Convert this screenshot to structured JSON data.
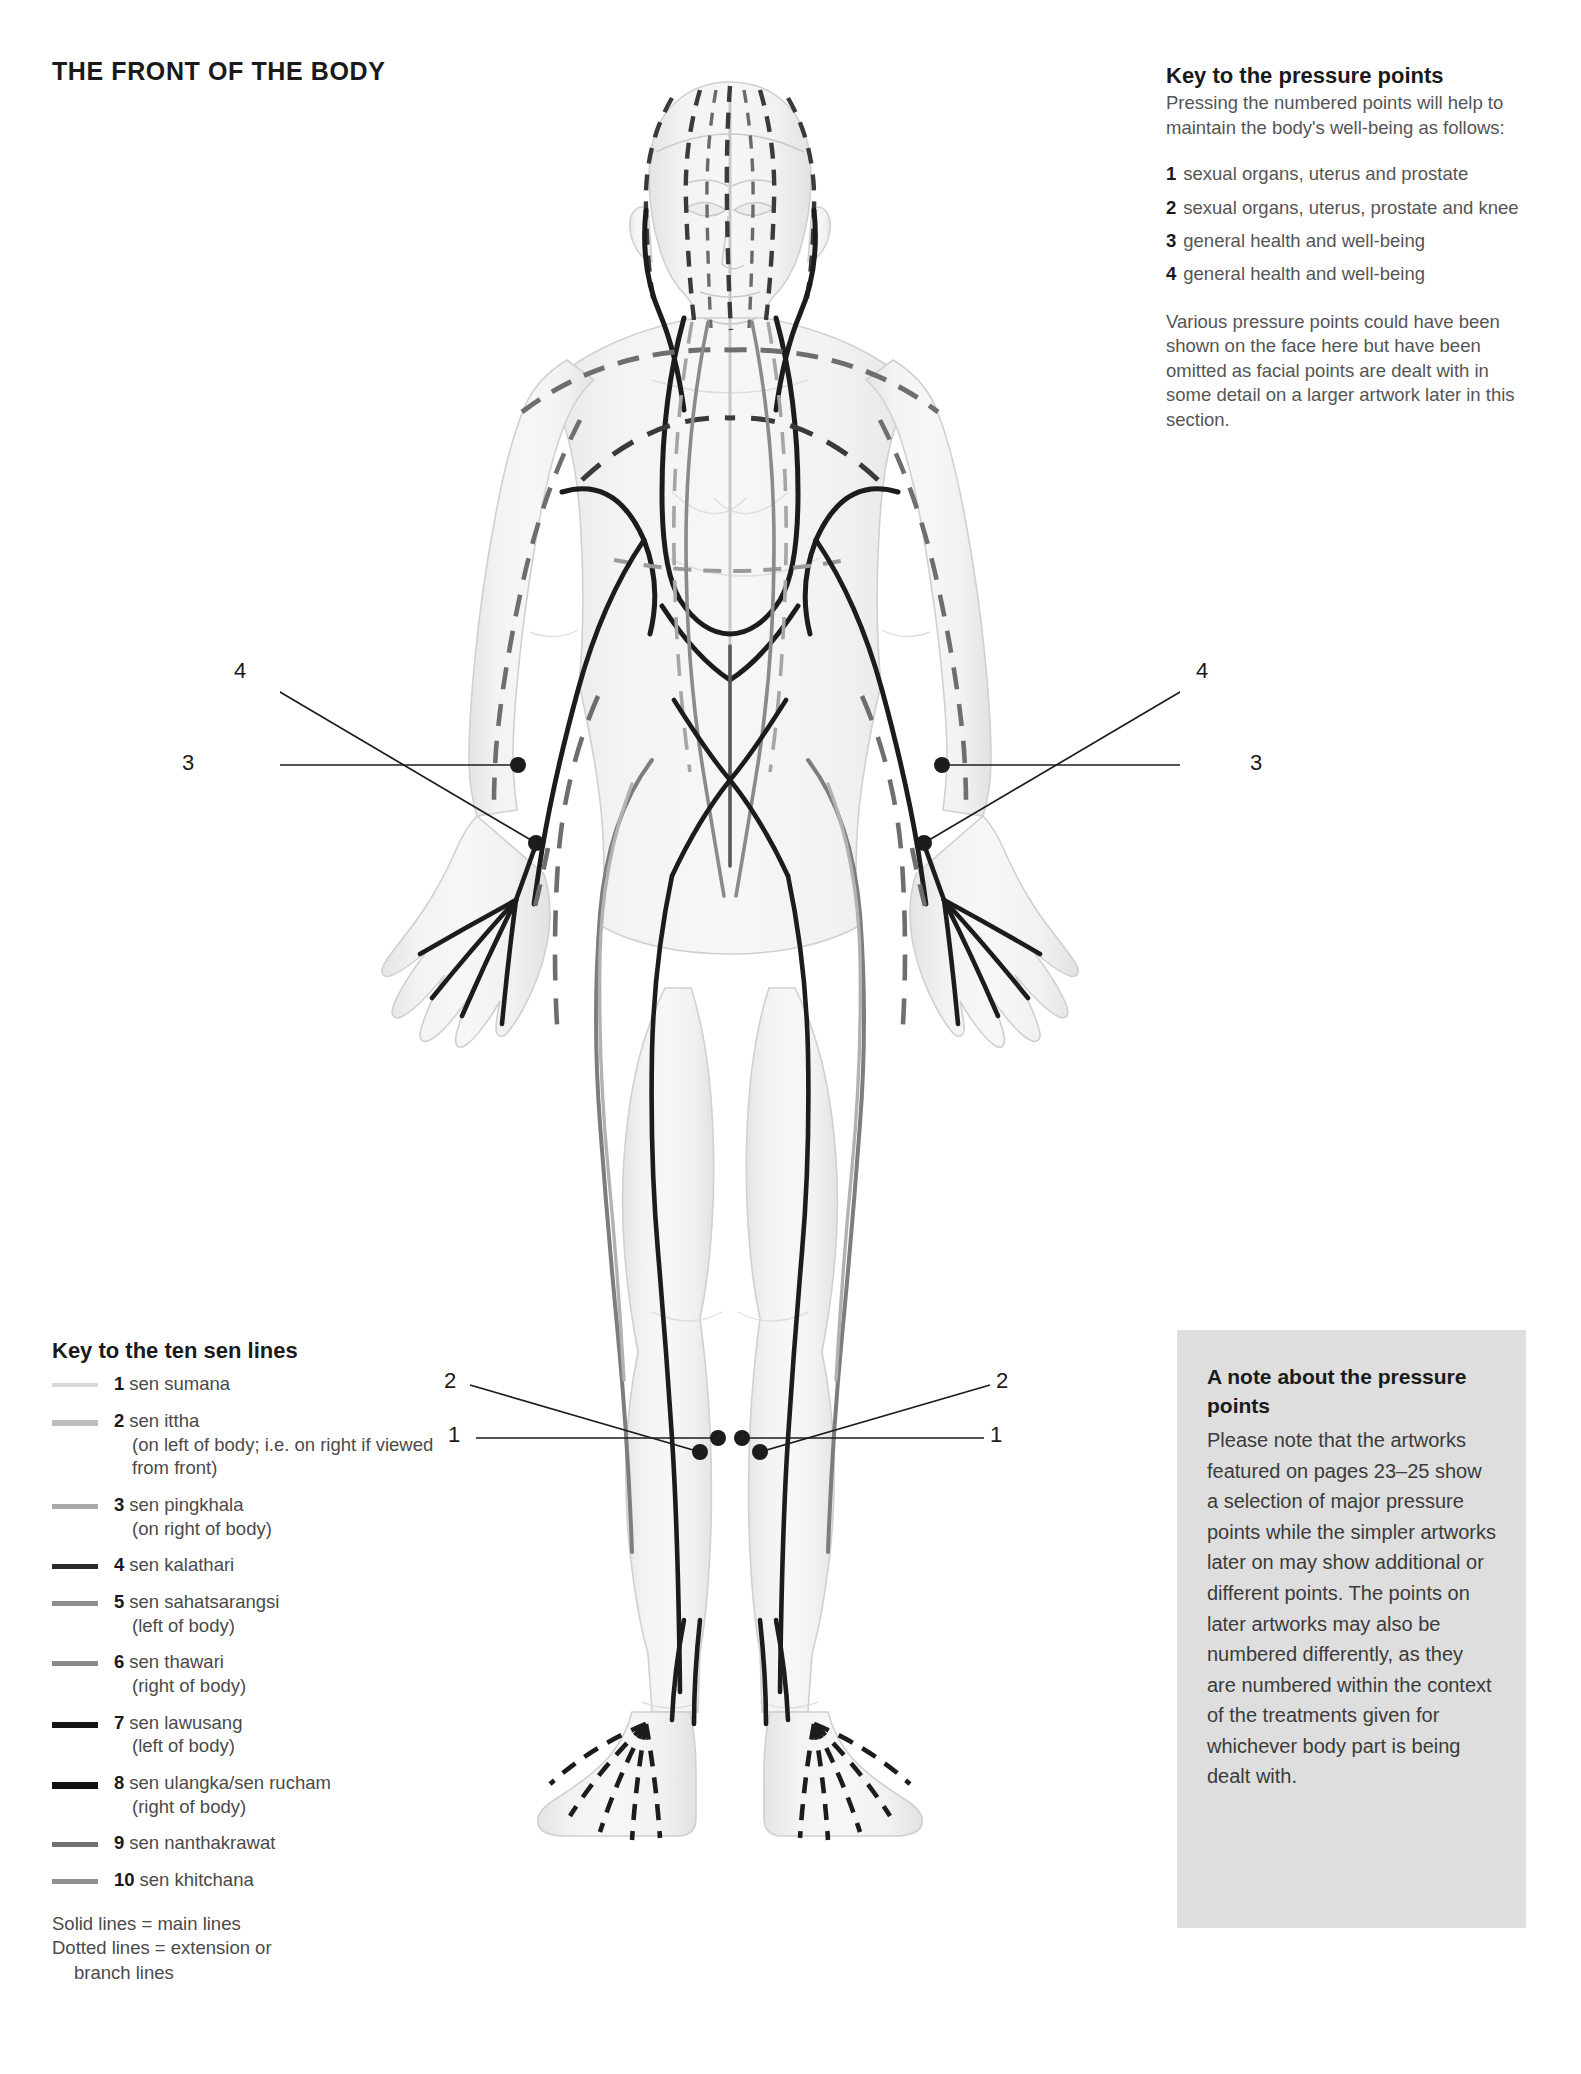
{
  "page": {
    "title": "THE FRONT OF THE BODY"
  },
  "pressure_key": {
    "heading": "Key to the pressure points",
    "intro": "Pressing the numbered points will help to maintain the body's well-being as follows:",
    "items": [
      {
        "num": "1",
        "text": "sexual organs, uterus and prostate"
      },
      {
        "num": "2",
        "text": "sexual organs, uterus, prostate and knee"
      },
      {
        "num": "3",
        "text": "general health and well-being"
      },
      {
        "num": "4",
        "text": "general health and well-being"
      }
    ],
    "footnote": "Various pressure points could have been shown on the face here but have been omitted as facial points are dealt with in some detail on a larger artwork later in this section."
  },
  "sen_key": {
    "heading": "Key to the ten sen lines",
    "items": [
      {
        "num": "1",
        "name": "sen sumana",
        "detail": "",
        "color": "#d8d8d8",
        "thickness": 4
      },
      {
        "num": "2",
        "name": "sen ittha",
        "detail": "(on left of body; i.e. on right if viewed from front)",
        "color": "#bdbdbd",
        "thickness": 6
      },
      {
        "num": "3",
        "name": "sen pingkhala",
        "detail": "(on right of body)",
        "color": "#a9a9a9",
        "thickness": 5
      },
      {
        "num": "4",
        "name": "sen kalathari",
        "detail": "",
        "color": "#2b2b2b",
        "thickness": 5
      },
      {
        "num": "5",
        "name": "sen sahatsarangsi",
        "detail": "(left of body)",
        "color": "#8e8e8e",
        "thickness": 5
      },
      {
        "num": "6",
        "name": "sen thawari",
        "detail": "(right of body)",
        "color": "#8a8a8a",
        "thickness": 5
      },
      {
        "num": "7",
        "name": "sen lawusang",
        "detail": "(left of body)",
        "color": "#141414",
        "thickness": 6
      },
      {
        "num": "8",
        "name": "sen ulangka/sen rucham",
        "detail": "(right of body)",
        "color": "#111111",
        "thickness": 7
      },
      {
        "num": "9",
        "name": "sen nanthakrawat",
        "detail": "",
        "color": "#707070",
        "thickness": 5
      },
      {
        "num": "10",
        "name": "sen khitchana",
        "detail": "",
        "color": "#909090",
        "thickness": 5
      }
    ],
    "footnote_line1": "Solid lines = main lines",
    "footnote_line2": "Dotted lines = extension or",
    "footnote_line3": "branch lines"
  },
  "note_box": {
    "heading": "A note about the pressure points",
    "body": "Please note that the artworks featured on pages 23–25 show a selection of major pressure points while the simpler artworks later on may show additional or different points. The points on later artworks may also be numbered differently, as they are numbered within the context of the treatments given for whichever body part is being dealt with."
  },
  "callouts": [
    {
      "id": "left-wrist-4",
      "label": "4",
      "x": 237,
      "y": 669
    },
    {
      "id": "left-wrist-3",
      "label": "3",
      "x": 185,
      "y": 745
    },
    {
      "id": "right-wrist-4",
      "label": "4",
      "x": 930,
      "y": 669
    },
    {
      "id": "right-wrist-3",
      "label": "3",
      "x": 983,
      "y": 745
    },
    {
      "id": "left-ankle-2",
      "label": "2",
      "x": 446,
      "y": 1368
    },
    {
      "id": "left-ankle-1",
      "label": "1",
      "x": 452,
      "y": 1419
    },
    {
      "id": "right-ankle-2",
      "label": "2",
      "x": 752,
      "y": 1368
    },
    {
      "id": "right-ankle-1",
      "label": "1",
      "x": 752,
      "y": 1419
    }
  ],
  "figure": {
    "name": "front-view-female-body-sen-lines",
    "body_fill": "#f0f0f0",
    "body_stroke": "#d2d2d2",
    "line_black": "#1c1c1c",
    "line_grey": "#777777",
    "line_light": "#b5b5b5"
  }
}
